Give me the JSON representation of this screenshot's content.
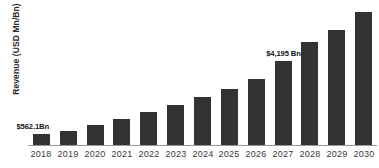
{
  "chart_data": {
    "type": "bar",
    "title": "",
    "xlabel": "",
    "ylabel": "Revenue (USD Mn/Bn)",
    "grid": false,
    "legend": "none",
    "ylim": [
      0,
      7000
    ],
    "categories": [
      "2018",
      "2019",
      "2020",
      "2021",
      "2022",
      "2023",
      "2024",
      "2025",
      "2026",
      "2027",
      "2028",
      "2029",
      "2030"
    ],
    "values": [
      562.1,
      700,
      1000,
      1300,
      1650,
      2000,
      2400,
      2800,
      3300,
      4195,
      5100,
      5700,
      6600
    ],
    "annotations": [
      {
        "category": "2018",
        "text": "$562.1Bn",
        "placement": "left"
      },
      {
        "category": "2027",
        "text": "$4,195 Bn",
        "placement": "above"
      }
    ],
    "bar_color": "#333333",
    "axis_color": "#9a9a9a",
    "background": "#ffffff"
  }
}
